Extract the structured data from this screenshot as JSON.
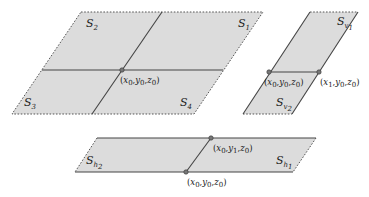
{
  "diagram": {
    "panels": {
      "quad": {
        "regions": [
          {
            "id": "S1",
            "base": "S",
            "sub": "1"
          },
          {
            "id": "S2",
            "base": "S",
            "sub": "2"
          },
          {
            "id": "S3",
            "base": "S",
            "sub": "3"
          },
          {
            "id": "S4",
            "base": "S",
            "sub": "4"
          }
        ],
        "point_label": {
          "open": "(",
          "x": "x",
          "xs": "0",
          ",y": "y",
          "ys": "0",
          "z": "z",
          "zs": "0",
          "close": ")",
          "text": "(x0,y0,z0)"
        }
      },
      "vertical": {
        "regions": [
          {
            "id": "Sv1",
            "base": "S",
            "sub": "v",
            "subsub": "1"
          },
          {
            "id": "Sv2",
            "base": "S",
            "sub": "v",
            "subsub": "2"
          }
        ],
        "point_labels": [
          {
            "text": "(x0,y0,z0)"
          },
          {
            "text": "(x1,y0,z0)"
          }
        ]
      },
      "horizontal": {
        "regions": [
          {
            "id": "Sh1",
            "base": "S",
            "sub": "h",
            "subsub": "1"
          },
          {
            "id": "Sh2",
            "base": "S",
            "sub": "h",
            "subsub": "2"
          }
        ],
        "point_labels": [
          {
            "text": "(x0,y1,z0)"
          },
          {
            "text": "(x0,y0,z0)"
          }
        ]
      }
    },
    "colors": {
      "fill": "#dcdcdc",
      "edge": "#444444",
      "point": "#777777"
    }
  }
}
